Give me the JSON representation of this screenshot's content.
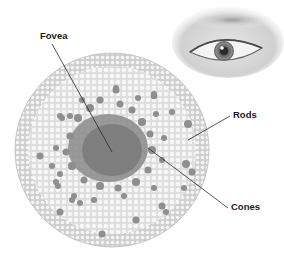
{
  "diagram": {
    "title": "",
    "labels": {
      "fovea": "Fovea",
      "rods": "Rods",
      "cones": "Cones"
    },
    "colors": {
      "background": "#ffffff",
      "retina_fill": "#d9d9d9",
      "rod_dot": "#f4f4f4",
      "cone_dot": "#8a8a8a",
      "cone_dense": "#7f7f7f",
      "leader_line": "#2a2a2a",
      "label_text": "#1a1a1a"
    },
    "elements": [
      {
        "id": "retina-disc",
        "type": "circle",
        "cx": 112,
        "cy": 150,
        "r": 97
      },
      {
        "id": "eye-illustration",
        "type": "image",
        "x": 172,
        "y": 0,
        "w": 112,
        "h": 80
      }
    ],
    "leaders": [
      {
        "label": "Fovea",
        "from": [
          52,
          44
        ],
        "to": [
          112,
          152
        ]
      },
      {
        "label": "Rods",
        "from": [
          230,
          116
        ],
        "to": [
          188,
          140
        ]
      },
      {
        "label": "Cones",
        "from": [
          228,
          208
        ],
        "to": [
          148,
          148
        ]
      }
    ]
  }
}
